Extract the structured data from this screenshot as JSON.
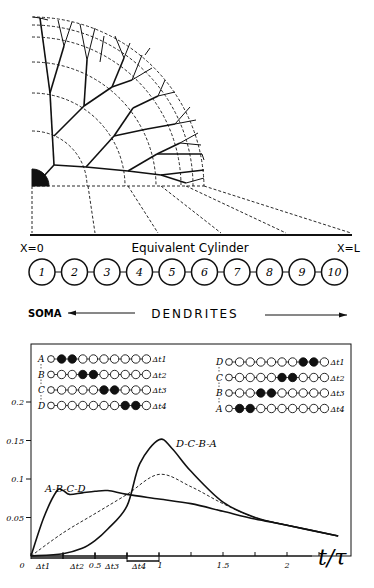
{
  "tree": {
    "soma_label": "",
    "cylinder_label": "Equivalent Cylinder",
    "left_label": "X=0",
    "right_label": "X=L"
  },
  "compartments": {
    "labels": [
      "1",
      "2",
      "3",
      "4",
      "5",
      "6",
      "7",
      "8",
      "9",
      "10"
    ],
    "soma_label": "SOMA",
    "dendrites_label": "DENDRITES"
  },
  "sequences": {
    "left": {
      "rows": [
        {
          "letter": "A",
          "filled": [
            2,
            3
          ],
          "dt": "Δt1"
        },
        {
          "letter": "B",
          "filled": [
            4,
            5
          ],
          "dt": "Δt2"
        },
        {
          "letter": "C",
          "filled": [
            6,
            7
          ],
          "dt": "Δt3"
        },
        {
          "letter": "D",
          "filled": [
            8,
            9
          ],
          "dt": "Δt4"
        }
      ]
    },
    "right": {
      "rows": [
        {
          "letter": "D",
          "filled": [
            8,
            9
          ],
          "dt": "Δt1"
        },
        {
          "letter": "C",
          "filled": [
            6,
            7
          ],
          "dt": "Δt2"
        },
        {
          "letter": "B",
          "filled": [
            4,
            5
          ],
          "dt": "Δt3"
        },
        {
          "letter": "A",
          "filled": [
            2,
            3
          ],
          "dt": "Δt4"
        }
      ]
    },
    "first_symbol": "①"
  },
  "chart_data": {
    "type": "line",
    "title": "",
    "xlabel": "t/τ",
    "ylabel": "",
    "xlim": [
      0,
      2.4
    ],
    "ylim": [
      0,
      0.2
    ],
    "x_ticks": [
      "0",
      "0.5",
      "1",
      "1.5",
      "2"
    ],
    "y_ticks": [
      "0.05",
      "0.1",
      "0.15",
      "0.2"
    ],
    "interval_labels": [
      "Δt1",
      "Δt2",
      "Δt3",
      "Δt4"
    ],
    "grid": false,
    "series": [
      {
        "name": "A-B-C-D",
        "style": "solid",
        "x": [
          0,
          0.1,
          0.2,
          0.25,
          0.3,
          0.4,
          0.5,
          0.6,
          0.75,
          1.0,
          1.25,
          1.5,
          1.75,
          2.0,
          2.4
        ],
        "y": [
          0,
          0.05,
          0.084,
          0.085,
          0.08,
          0.082,
          0.084,
          0.085,
          0.08,
          0.074,
          0.068,
          0.058,
          0.048,
          0.04,
          0.026
        ]
      },
      {
        "name": "D-C-B-A",
        "style": "solid",
        "x": [
          0,
          0.25,
          0.4,
          0.5,
          0.6,
          0.75,
          0.85,
          1.0,
          1.1,
          1.25,
          1.5,
          1.75,
          2.0,
          2.4
        ],
        "y": [
          0,
          0.003,
          0.01,
          0.02,
          0.035,
          0.065,
          0.12,
          0.151,
          0.14,
          0.11,
          0.07,
          0.05,
          0.04,
          0.026
        ]
      },
      {
        "name": "linear-sum",
        "style": "dashed",
        "x": [
          0,
          0.25,
          0.5,
          0.75,
          1.0,
          1.25,
          1.5,
          1.75,
          2.0,
          2.4
        ],
        "y": [
          0,
          0.03,
          0.055,
          0.08,
          0.106,
          0.09,
          0.068,
          0.05,
          0.04,
          0.026
        ]
      }
    ],
    "annotations": [
      "A-B-C-D",
      "D-C-B-A"
    ]
  }
}
